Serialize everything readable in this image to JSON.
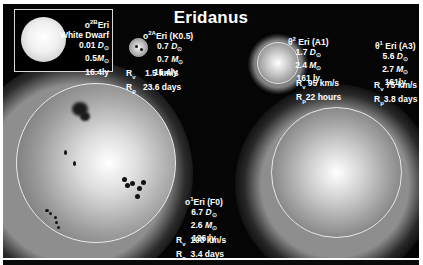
{
  "title": "Eridanus",
  "colors": {
    "background": "#050505",
    "text": "#ffffff",
    "frame": "#ffffff"
  },
  "inset": {
    "name_prefix": "o",
    "name_sup": "2B",
    "name_suffix": "Eri",
    "type": "White Dwarf",
    "diameter_value": "0.01",
    "diameter_unit": "D",
    "mass_value": "0.5",
    "mass_unit": "M",
    "distance": "16.4ly"
  },
  "stars": [
    {
      "id": "o2A-eri",
      "name_prefix": "o",
      "name_sup": "2A",
      "name_suffix": "Eri (K0.5)",
      "diameter_value": "0.7",
      "diameter_unit": "D",
      "mass_value": "0.7",
      "mass_unit": "M",
      "distance": "16.4ly",
      "rv_label": "R",
      "rv_sub": "v",
      "rv_value": "1.5 km/s",
      "rp_label": "R",
      "rp_sub": "p",
      "rp_value": "23.6 days"
    },
    {
      "id": "theta2-eri",
      "name_prefix": "θ",
      "name_sup": "2",
      "name_suffix": "Eri (A1)",
      "diameter_value": "1.7",
      "diameter_unit": "D",
      "mass_value": "2.4",
      "mass_unit": "M",
      "distance": "161 ly",
      "rv_label": "R",
      "rv_sub": "v",
      "rv_value": "95 km/s",
      "rp_label": "R",
      "rp_sub": "p",
      "rp_value": "22 hours"
    },
    {
      "id": "theta1-eri",
      "name_prefix": "θ",
      "name_sup": "1",
      "name_suffix": "Eri (A3)",
      "diameter_value": "5.6",
      "diameter_unit": "D",
      "mass_value": "2.7",
      "mass_unit": "M",
      "distance": "161ly",
      "rv_label": "R",
      "rv_sub": "v",
      "rv_value": "75 km/s",
      "rp_label": "R",
      "rp_sub": "p",
      "rp_value": "3.8 days"
    },
    {
      "id": "o1-eri",
      "name_prefix": "o",
      "name_sup": "1",
      "name_suffix": "Eri (F0)",
      "diameter_value": "6.7",
      "diameter_unit": "D",
      "mass_value": "2.6",
      "mass_unit": "M",
      "distance": "126 ly",
      "rv_label": "R",
      "rv_sub": "v",
      "rv_value": "100 km/s",
      "rp_label": "R",
      "rp_sub": "p",
      "rp_value": "3.4 days"
    }
  ],
  "sun_symbol": "⊙"
}
